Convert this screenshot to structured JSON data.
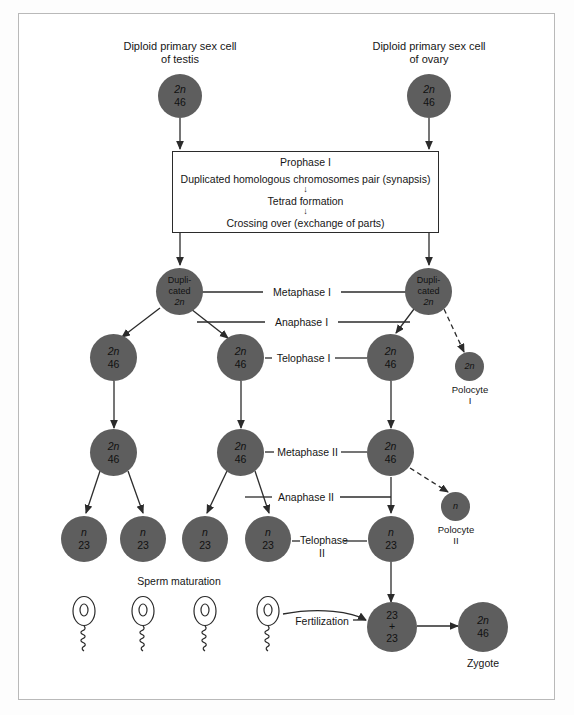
{
  "figure": {
    "background": "#ffffff",
    "cell_fill": "#5e5e5e",
    "line_color": "#2b2b2b",
    "frame_color": "#b9b9b9"
  },
  "headers": {
    "testis": "Diploid primary sex cell\nof testis",
    "ovary": "Diploid primary sex cell\nof ovary"
  },
  "prophase_box": {
    "title": "Prophase I",
    "line1": "Duplicated homologous chromosomes pair (synapsis)",
    "arrow1": "↓",
    "line2": "Tetrad formation",
    "arrow2": "↓",
    "line3": "Crossing over (exchange of parts)"
  },
  "phases": {
    "metaphase_1": "Metaphase I",
    "anaphase_1": "Anaphase I",
    "telophase_1": "Telophase I",
    "metaphase_2": "Metaphase II",
    "anaphase_2": "Anaphase II",
    "telophase_2": "Telophase\nII",
    "sperm_maturation": "Sperm maturation",
    "fertilization": "Fertilization"
  },
  "labels": {
    "polocyte_1": "Polocyte\nI",
    "polocyte_2": "Polocyte\nII",
    "zygote": "Zygote"
  },
  "cells": {
    "primary_testis": {
      "line1": "2n",
      "line2": "46"
    },
    "primary_ovary": {
      "line1": "2n",
      "line2": "46"
    },
    "duplicated_left": {
      "line1": "Dupli-",
      "line2": "cated",
      "line3": "2n"
    },
    "duplicated_right": {
      "line1": "Dupli-",
      "line2": "cated",
      "line3": "2n"
    },
    "secondary_a": {
      "line1": "2n",
      "line2": "46"
    },
    "secondary_b": {
      "line1": "2n",
      "line2": "46"
    },
    "secondary_oocyte": {
      "line1": "2n",
      "line2": "46"
    },
    "polocyte_1_cell": {
      "line1": "2n"
    },
    "metaphase2_a": {
      "line1": "2n",
      "line2": "46"
    },
    "metaphase2_b": {
      "line1": "2n",
      "line2": "46"
    },
    "metaphase2_oocyte": {
      "line1": "2n",
      "line2": "46"
    },
    "polocyte_2_cell": {
      "line1": "n"
    },
    "spermatid_1": {
      "line1": "n",
      "line2": "23"
    },
    "spermatid_2": {
      "line1": "n",
      "line2": "23"
    },
    "spermatid_3": {
      "line1": "n",
      "line2": "23"
    },
    "spermatid_4": {
      "line1": "n",
      "line2": "23"
    },
    "ovum": {
      "line1": "n",
      "line2": "23"
    },
    "fertilized": {
      "line1": "23",
      "line2": "+",
      "line3": "23"
    },
    "zygote_cell": {
      "line1": "2n",
      "line2": "46"
    }
  }
}
